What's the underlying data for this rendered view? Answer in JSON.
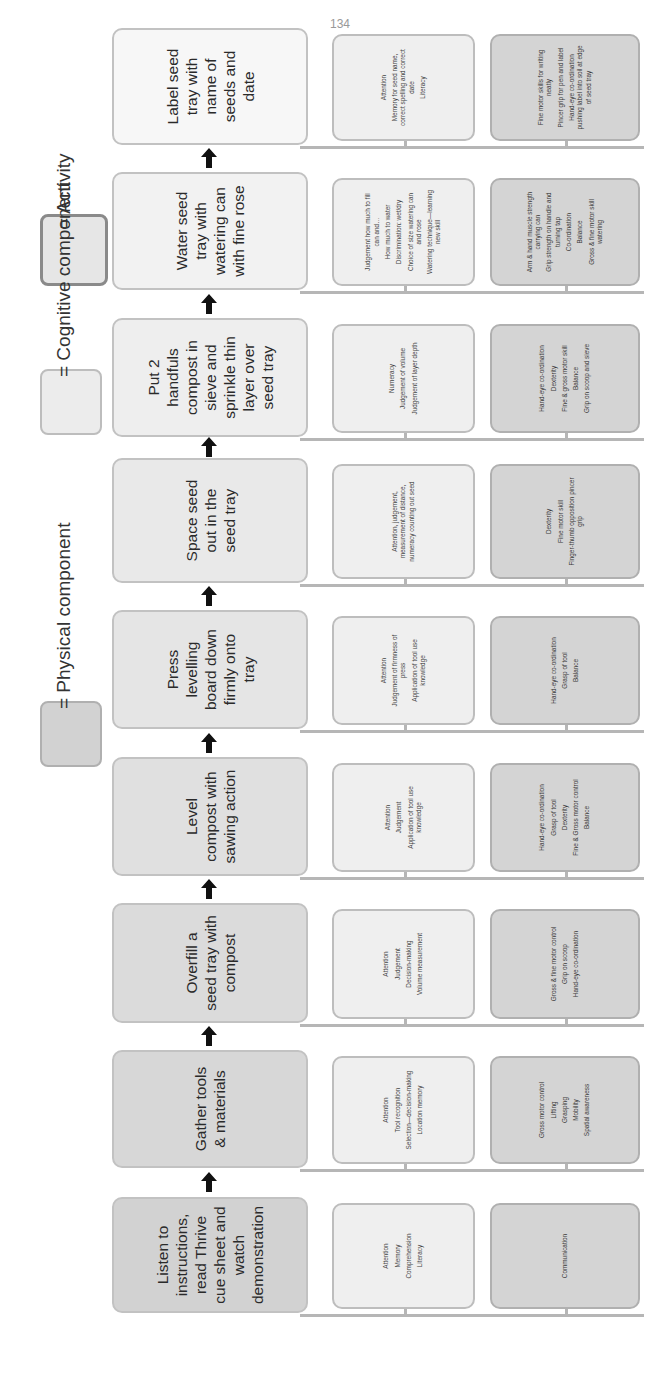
{
  "legend": {
    "activity_label": "= Activity",
    "cognitive_label": "= Cognitive component",
    "physical_label": "= Physical component"
  },
  "colors": {
    "activity_dark": "#cfcfcf",
    "activity_light": "#f6f6f6",
    "cognitive": "#efefef",
    "physical": "#d4d4d4",
    "arrow": "#111111",
    "connector": "#b6b6b6"
  },
  "steps": [
    {
      "activity": "Listen to instructions, read Thrive cue sheet and watch demonstration",
      "cognitive": [
        "Attention",
        "Memory",
        "Comprehension",
        "Literacy"
      ],
      "physical": [
        "Communication"
      ]
    },
    {
      "activity": "Gather tools & materials",
      "cognitive": [
        "Attention",
        "Tool recognition",
        "Selection—decision-making",
        "Location memory"
      ],
      "physical": [
        "Gross motor control",
        "Lifting",
        "Grasping",
        "Mobility",
        "Spatial awareness"
      ]
    },
    {
      "activity": "Overfill a seed tray with compost",
      "cognitive": [
        "Attention",
        "Judgement",
        "Decision-making",
        "Volume measurement"
      ],
      "physical": [
        "Gross & fine motor control",
        "Grip on scoop",
        "Hand-eye co-ordination"
      ]
    },
    {
      "activity": "Level compost with sawing action",
      "cognitive": [
        "Attention",
        "Judgement",
        "Application of tool use knowledge"
      ],
      "physical": [
        "Hand-eye co-ordination",
        "Grasp of tool",
        "Dexterity",
        "Fine & Gross motor control",
        "Balance"
      ]
    },
    {
      "activity": "Press levelling board down firmly onto tray",
      "cognitive": [
        "Attention",
        "Judgement of firmness of press",
        "Application of tool use knowledge"
      ],
      "physical": [
        "Hand-eye co-ordination",
        "Grasp of tool",
        "Balance"
      ]
    },
    {
      "activity": "Space seed out in the seed tray",
      "cognitive": [
        "Attention, judgement, measurement of distance, numeracy counting out seed"
      ],
      "physical": [
        "Dexterity",
        "Fine motor skill",
        "Finger-thumb opposition pincer grip"
      ]
    },
    {
      "activity": "Put 2 handfuls compost in sieve and sprinkle thin layer over seed tray",
      "cognitive": [
        "Numeracy",
        "Judgement of volume",
        "Judgement of layer depth"
      ],
      "physical": [
        "Hand-eye co-ordination",
        "Dexterity",
        "Fine & gross motor skill",
        "Balance",
        "Grip on scoop and sieve"
      ]
    },
    {
      "activity": "Water seed tray with watering can with fine rose",
      "cognitive": [
        "Judgement how much to fill can and…",
        "How much to water",
        "Discrimination: wet/dry",
        "Choice of size watering can and rose",
        "Watering technique—learning new skill"
      ],
      "physical": [
        "Arm & hand muscle strength carrying can",
        "Grip strength on handle and turning tap",
        "Co-ordination",
        "Balance",
        "Gross & fine motor skill watering"
      ]
    },
    {
      "activity": "Label seed tray with name of seeds and date",
      "cognitive": [
        "Attention",
        "Memory for seed name, correct spelling and correct date",
        "Literacy"
      ],
      "physical": [
        "Fine motor skills for writing neatly",
        "Pincer grip for pen and label",
        "Hand-eye co-ordination pushing label into soil at edge of seed tray"
      ]
    }
  ],
  "footer": {
    "page_number": "134"
  }
}
